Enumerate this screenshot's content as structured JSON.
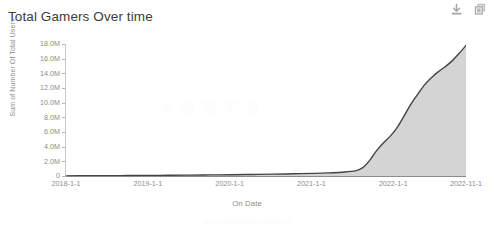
{
  "header": {
    "title": "Total Gamers Over time",
    "toolbar": [
      {
        "name": "download-icon",
        "label": "Download"
      },
      {
        "name": "copy-icon",
        "label": "Copy"
      }
    ]
  },
  "watermark": {
    "text": "大 数 据 平 台",
    "bottom_text": "本文由数据分析平台生成"
  },
  "chart_data": {
    "type": "area",
    "title": "Total Gamers Over time",
    "xlabel": "On Date",
    "ylabel": "Sum of Number Of Total Users",
    "grid": false,
    "legend": null,
    "ylim": [
      0,
      18000000
    ],
    "ytick_labels": [
      "18.0M",
      "16.0M",
      "14.0M",
      "12.0M",
      "10.0M",
      "8.0M",
      "6.0M",
      "4.0M",
      "2.0M",
      "0"
    ],
    "ytick_values": [
      18000000,
      16000000,
      14000000,
      12000000,
      10000000,
      8000000,
      6000000,
      4000000,
      2000000,
      0
    ],
    "xtick_labels": [
      "2018-1-1",
      "2019-1-1",
      "2020-1-1",
      "2021-1-1",
      "2022-1-1",
      "2022-11-1"
    ],
    "xtick_positions": [
      0.0,
      0.2045,
      0.4091,
      0.6136,
      0.8182,
      1.0
    ],
    "series": [
      {
        "name": "Sum of Number Of Total Users",
        "line_color": "#444444",
        "fill_color": "#d4d4d4",
        "x": [
          "2018-01-01",
          "2018-04-01",
          "2018-07-01",
          "2018-10-01",
          "2019-01-01",
          "2019-04-01",
          "2019-07-01",
          "2019-10-01",
          "2020-01-01",
          "2020-04-01",
          "2020-07-01",
          "2020-10-01",
          "2021-01-01",
          "2021-03-01",
          "2021-05-01",
          "2021-07-01",
          "2021-08-01",
          "2021-09-01",
          "2021-10-01",
          "2021-11-01",
          "2021-12-01",
          "2022-01-01",
          "2022-02-01",
          "2022-03-01",
          "2022-04-01",
          "2022-05-01",
          "2022-06-01",
          "2022-07-01",
          "2022-08-01",
          "2022-09-01",
          "2022-10-01",
          "2022-11-01"
        ],
        "values": [
          20000,
          30000,
          45000,
          60000,
          80000,
          100000,
          125000,
          150000,
          180000,
          210000,
          250000,
          300000,
          360000,
          420000,
          520000,
          700000,
          1100000,
          2100000,
          3400000,
          4500000,
          5400000,
          6600000,
          8200000,
          9700000,
          11100000,
          12400000,
          13400000,
          14200000,
          14900000,
          15700000,
          16700000,
          17800000
        ]
      }
    ]
  }
}
